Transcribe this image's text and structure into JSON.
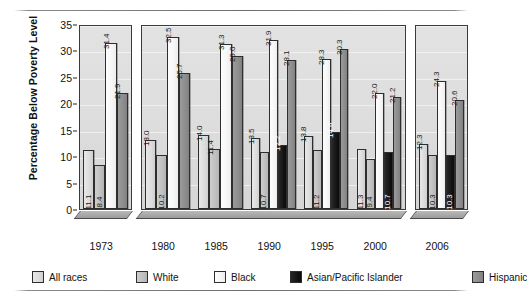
{
  "chart_data": {
    "type": "bar",
    "title": "",
    "subtitle": "",
    "xlabel": "",
    "ylabel": "Percentage Below Poverty Level",
    "ylim": [
      0,
      35
    ],
    "ytick_step": 5,
    "yticks": [
      "0",
      "5",
      "10",
      "15",
      "20",
      "25",
      "30",
      "35"
    ],
    "grid": true,
    "legend_position": "bottom",
    "categories": [
      "1973",
      "1980",
      "1985",
      "1990",
      "1995",
      "2000",
      "2006"
    ],
    "panels": [
      {
        "name": "panel-1973",
        "categories": [
          "1973"
        ]
      },
      {
        "name": "panel-1980-2000",
        "categories": [
          "1980",
          "1985",
          "1990",
          "1995",
          "2000"
        ]
      },
      {
        "name": "panel-2006",
        "categories": [
          "2006"
        ]
      }
    ],
    "series": [
      {
        "name": "All races",
        "key": "all",
        "color": "#dcdcdc",
        "values": [
          11.1,
          13.0,
          14.0,
          13.5,
          13.8,
          11.3,
          12.3
        ]
      },
      {
        "name": "White",
        "key": "white",
        "color": "#c0c0c0",
        "values": [
          8.4,
          10.2,
          11.4,
          10.7,
          11.2,
          9.4,
          10.3
        ]
      },
      {
        "name": "Black",
        "key": "black",
        "color": "#f6f6f6",
        "values": [
          31.4,
          32.5,
          31.3,
          31.9,
          28.3,
          22.0,
          24.3
        ]
      },
      {
        "name": "Asian/Pacific Islander",
        "key": "asian",
        "color": "#151515",
        "values": [
          null,
          null,
          null,
          12.2,
          14.6,
          10.7,
          10.3
        ]
      },
      {
        "name": "Hispanic",
        "key": "hisp",
        "color": "#8d8d8d",
        "values": [
          21.9,
          25.7,
          29.0,
          28.1,
          30.3,
          21.2,
          20.6
        ]
      }
    ],
    "data_labels": {
      "1973": {
        "All races": "11.1",
        "White": "8.4",
        "Black": "31.4",
        "Asian/Pacific Islander": "",
        "Hispanic": "21.9"
      },
      "1980": {
        "All races": "13.0",
        "White": "10.2",
        "Black": "32.5",
        "Asian/Pacific Islander": "",
        "Hispanic": "25.7"
      },
      "1985": {
        "All races": "14.0",
        "White": "11.4",
        "Black": "31.3",
        "Asian/Pacific Islander": "",
        "Hispanic": "29.0"
      },
      "1990": {
        "All races": "13.5",
        "White": "10.7",
        "Black": "31.9",
        "Asian/Pacific Islander": "12.2",
        "Hispanic": "28.1"
      },
      "1995": {
        "All races": "13.8",
        "White": "11.2",
        "Black": "28.3",
        "Asian/Pacific Islander": "14.6",
        "Hispanic": "30.3"
      },
      "2000": {
        "All races": "11.3",
        "White": "9.4",
        "Black": "22.0",
        "Asian/Pacific Islander": "10.7",
        "Hispanic": "21.2"
      },
      "2006": {
        "All races": "12.3",
        "White": "10.3",
        "Black": "24.3",
        "Asian/Pacific Islander": "10.3",
        "Hispanic": "20.6"
      }
    }
  },
  "legend": {
    "items": [
      {
        "label": "All races",
        "key": "all"
      },
      {
        "label": "White",
        "key": "white"
      },
      {
        "label": "Black",
        "key": "black"
      },
      {
        "label": "Asian/Pacific Islander",
        "key": "asian"
      },
      {
        "label": "Hispanic",
        "key": "hisp"
      }
    ]
  }
}
